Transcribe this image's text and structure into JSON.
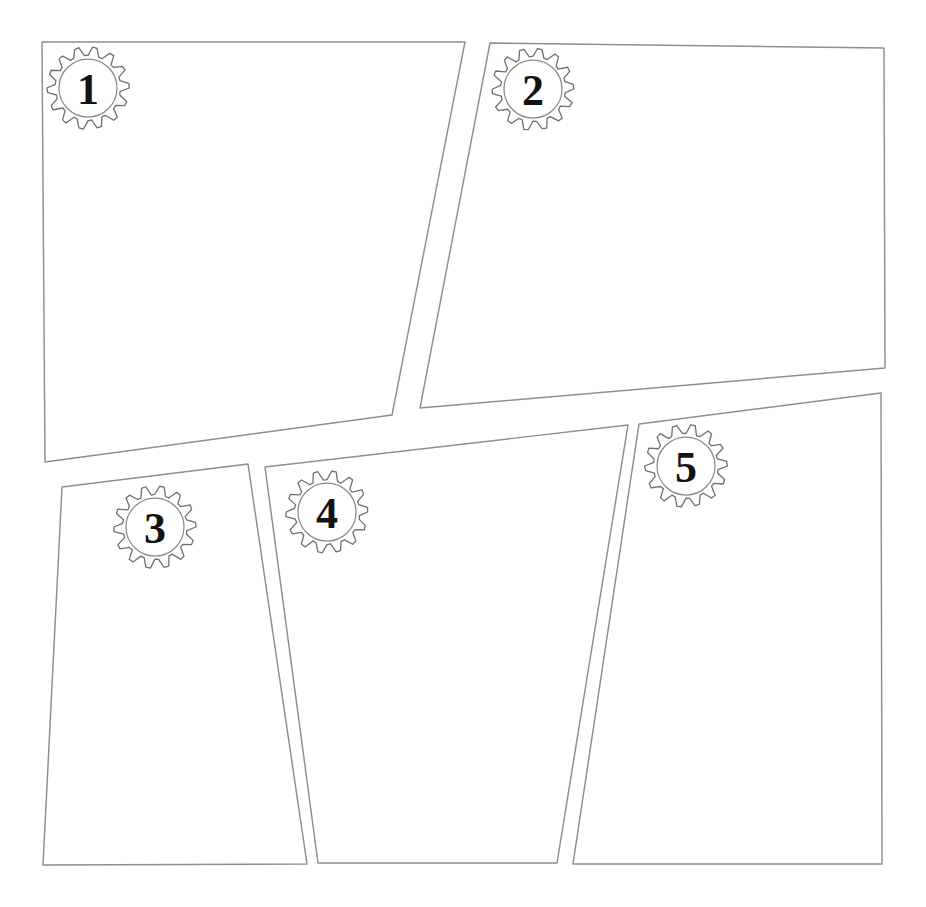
{
  "document": {
    "title": "Numbered Comic Panel Template",
    "background_color": "#ffffff",
    "line_color": "#8e8e8e",
    "badge_fill_color": "#ffffff",
    "badge_stroke_color": "#6f6f6f",
    "number_color": "#121212",
    "canvas": {
      "width": 926,
      "height": 907
    }
  },
  "panels": [
    {
      "id": "panel-1",
      "number": "1",
      "badge_icon": "gear-icon",
      "badge": {
        "cx": 88,
        "cy": 88,
        "r_outer": 41,
        "r_inner": 29,
        "teeth": 14
      },
      "points": "42,42 465,42 392,415 45,462"
    },
    {
      "id": "panel-2",
      "number": "2",
      "badge_icon": "gear-icon",
      "badge": {
        "cx": 533,
        "cy": 89,
        "r_outer": 41,
        "r_inner": 29,
        "teeth": 14
      },
      "points": "490,43 884,48 885,368 420,408"
    },
    {
      "id": "panel-3",
      "number": "3",
      "badge_icon": "gear-icon",
      "badge": {
        "cx": 155,
        "cy": 527,
        "r_outer": 41,
        "r_inner": 29,
        "teeth": 14
      },
      "points": "62,487 248,464 307,864 43,865"
    },
    {
      "id": "panel-4",
      "number": "4",
      "badge_icon": "gear-icon",
      "badge": {
        "cx": 327,
        "cy": 512,
        "r_outer": 41,
        "r_inner": 29,
        "teeth": 14
      },
      "points": "265,467 628,425 557,863 318,863"
    },
    {
      "id": "panel-5",
      "number": "5",
      "badge_icon": "gear-icon",
      "badge": {
        "cx": 686,
        "cy": 466,
        "r_outer": 41,
        "r_inner": 29,
        "teeth": 14
      },
      "points": "639,424 881,393 882,864 573,864"
    }
  ]
}
